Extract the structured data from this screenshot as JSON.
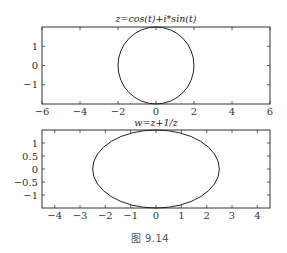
{
  "caption": "图 9.14",
  "chart_data": [
    {
      "type": "line",
      "title": "z=cos(t)+i*sin(t)",
      "xlabel": "",
      "ylabel": "",
      "xlim": [
        -6,
        6
      ],
      "ylim": [
        -2,
        2
      ],
      "xticks": [
        -6,
        -4,
        -2,
        0,
        2,
        4,
        6
      ],
      "xtick_labels": [
        "−6",
        "−4",
        "−2",
        "0",
        "2",
        "4",
        "6"
      ],
      "yticks": [
        -1,
        0,
        1
      ],
      "ytick_labels": [
        "−1",
        "0",
        "1"
      ],
      "grid": false,
      "series": [
        {
          "name": "circle",
          "shape": "ellipse",
          "center": [
            0,
            0
          ],
          "rx": 2,
          "ry": 2
        }
      ]
    },
    {
      "type": "line",
      "title": "w=z+1/z",
      "xlabel": "",
      "ylabel": "",
      "xlim": [
        -4.5,
        4.5
      ],
      "ylim": [
        -1.5,
        1.5
      ],
      "xticks": [
        -4,
        -3,
        -2,
        -1,
        0,
        1,
        2,
        3,
        4
      ],
      "xtick_labels": [
        "−4",
        "−3",
        "−2",
        "−1",
        "0",
        "1",
        "2",
        "3",
        "4"
      ],
      "yticks": [
        -1,
        -0.5,
        0,
        0.5,
        1
      ],
      "ytick_labels": [
        "−1",
        "−0.5",
        "0",
        "0.5",
        "1"
      ],
      "grid": false,
      "series": [
        {
          "name": "ellipse",
          "shape": "ellipse",
          "center": [
            0,
            0
          ],
          "rx": 2.5,
          "ry": 1.5
        }
      ]
    }
  ]
}
